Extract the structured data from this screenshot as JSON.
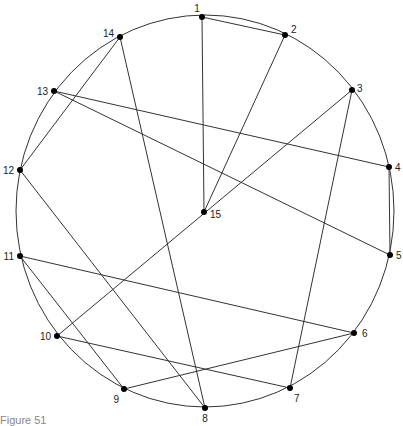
{
  "figure": {
    "caption": "Figure 51",
    "circle": {
      "cx": 205,
      "cy": 211,
      "rx": 189,
      "ry": 196
    },
    "stroke_color": "#333333",
    "node_color": "#000000",
    "nodes": [
      {
        "id": "1",
        "x": 202,
        "y": 17,
        "lx": -5,
        "ly": -5,
        "anchor": "middle"
      },
      {
        "id": "2",
        "x": 285,
        "y": 35,
        "lx": 6,
        "ly": -2,
        "anchor": "start"
      },
      {
        "id": "3",
        "x": 352,
        "y": 90,
        "lx": 5,
        "ly": 2,
        "anchor": "start"
      },
      {
        "id": "4",
        "x": 389,
        "y": 167,
        "lx": 6,
        "ly": 4,
        "anchor": "start"
      },
      {
        "id": "5",
        "x": 390,
        "y": 255,
        "lx": 6,
        "ly": 4,
        "anchor": "start"
      },
      {
        "id": "6",
        "x": 354,
        "y": 333,
        "lx": 8,
        "ly": 4,
        "anchor": "start"
      },
      {
        "id": "7",
        "x": 290,
        "y": 388,
        "lx": 4,
        "ly": 14,
        "anchor": "start"
      },
      {
        "id": "8",
        "x": 205,
        "y": 408,
        "lx": 0,
        "ly": 14,
        "anchor": "middle"
      },
      {
        "id": "9",
        "x": 124,
        "y": 389,
        "lx": -5,
        "ly": 14,
        "anchor": "end"
      },
      {
        "id": "10",
        "x": 57,
        "y": 336,
        "lx": -6,
        "ly": 4,
        "anchor": "end"
      },
      {
        "id": "11",
        "x": 20,
        "y": 256,
        "lx": -6,
        "ly": 4,
        "anchor": "end"
      },
      {
        "id": "12",
        "x": 20,
        "y": 170,
        "lx": -6,
        "ly": 4,
        "anchor": "end"
      },
      {
        "id": "13",
        "x": 54,
        "y": 91,
        "lx": -6,
        "ly": 4,
        "anchor": "end"
      },
      {
        "id": "14",
        "x": 120,
        "y": 37,
        "lx": -6,
        "ly": 0,
        "anchor": "end"
      },
      {
        "id": "15",
        "x": 204,
        "y": 212,
        "lx": 6,
        "ly": 6,
        "anchor": "start"
      }
    ],
    "edges": [
      [
        "1",
        "2"
      ],
      [
        "1",
        "15"
      ],
      [
        "2",
        "15"
      ],
      [
        "3",
        "10"
      ],
      [
        "3",
        "7"
      ],
      [
        "4",
        "5"
      ],
      [
        "4",
        "13"
      ],
      [
        "5",
        "13"
      ],
      [
        "6",
        "11"
      ],
      [
        "6",
        "9"
      ],
      [
        "7",
        "10"
      ],
      [
        "8",
        "14"
      ],
      [
        "8",
        "12"
      ],
      [
        "9",
        "11"
      ],
      [
        "12",
        "14"
      ]
    ]
  }
}
